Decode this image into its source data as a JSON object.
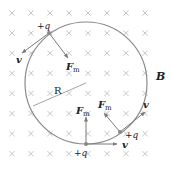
{
  "diagram": {
    "field_label": "B",
    "radius_label": "R",
    "charge_label": "+q",
    "velocity_label": "v",
    "force_label": "F",
    "force_subscript": "m",
    "colors": {
      "grid": "#b8b8b8",
      "circle": "#8a8a8a",
      "arrow": "#7a7a7a",
      "text": "#222222"
    },
    "grid": {
      "x0": 12,
      "y0": 13,
      "dx": 19,
      "dy": 20.1,
      "cols": 8,
      "rows": 8
    },
    "circle": {
      "cx": 86,
      "cy": 83,
      "r": 61
    }
  }
}
